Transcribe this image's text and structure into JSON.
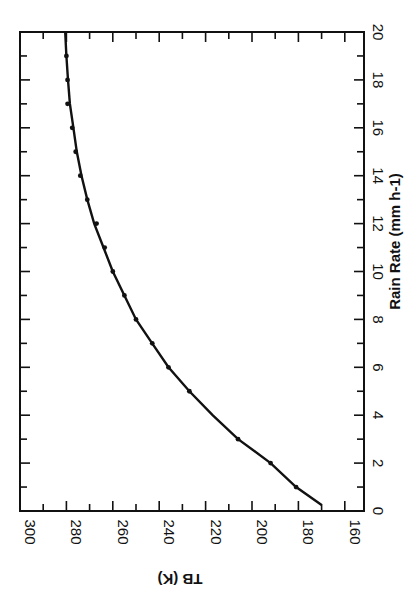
{
  "chart_data": {
    "type": "line",
    "orientation_note": "figure rotated 90 degrees clockwise on page",
    "title": "",
    "xlabel": "Rain Rate (mm h-1)",
    "ylabel": "TB (K)",
    "xlim": [
      0,
      20
    ],
    "ylim": [
      153,
      300
    ],
    "x_ticks": [
      0,
      2,
      4,
      6,
      8,
      10,
      12,
      14,
      16,
      18,
      20
    ],
    "y_ticks": [
      160,
      180,
      200,
      220,
      240,
      260,
      280,
      300
    ],
    "grid": false,
    "legend": null,
    "series": [
      {
        "name": "model curve",
        "style": "line",
        "x": [
          0.25,
          1,
          2,
          3,
          4,
          5,
          6,
          7,
          8,
          9,
          10,
          11,
          12,
          13,
          14,
          15,
          16,
          17,
          18,
          19,
          20
        ],
        "y": [
          170,
          181,
          192,
          206,
          217,
          227,
          236,
          243,
          250,
          255,
          260,
          264,
          268,
          271,
          273.5,
          275.5,
          277,
          278.5,
          279.3,
          280,
          280.5
        ]
      },
      {
        "name": "computed points",
        "style": "markers",
        "x": [
          1,
          2,
          3,
          5,
          6,
          7,
          8,
          9,
          10,
          11,
          12,
          13,
          14,
          15,
          16,
          17,
          18,
          19
        ],
        "y": [
          181,
          192,
          206,
          227,
          236,
          243,
          250,
          255,
          260,
          263.5,
          267,
          271,
          274,
          276,
          277.5,
          279.5,
          279.5,
          280
        ]
      }
    ]
  },
  "labels": {
    "x_title": "Rain Rate (mm h-1)",
    "y_title": "TB (K)",
    "x_ticks": [
      "0",
      "2",
      "4",
      "6",
      "8",
      "10",
      "12",
      "14",
      "16",
      "18",
      "20"
    ],
    "y_ticks": [
      "300",
      "280",
      "260",
      "240",
      "220",
      "200",
      "180",
      "160"
    ]
  }
}
